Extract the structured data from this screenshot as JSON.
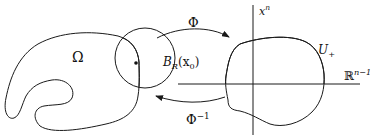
{
  "diagram": {
    "type": "flattening-the-boundary",
    "left_region": {
      "label": "Ω"
    },
    "ball": {
      "label_main": "B",
      "label_sub": "R",
      "label_arg": "(x",
      "label_arg_sub": "0",
      "label_close": ")"
    },
    "forward_map": {
      "label": "Φ"
    },
    "inverse_map": {
      "label": "Φ",
      "label_sup": "−1"
    },
    "vertical_axis": {
      "label": "x",
      "label_sup": "n"
    },
    "horizontal_axis": {
      "label": "ℝ",
      "label_sup": "n−1"
    },
    "upper_region": {
      "label": "U",
      "label_sub": "+"
    },
    "colors": {
      "stroke": "#1a1a1a",
      "hatch": "#555555",
      "background": "#ffffff"
    }
  }
}
